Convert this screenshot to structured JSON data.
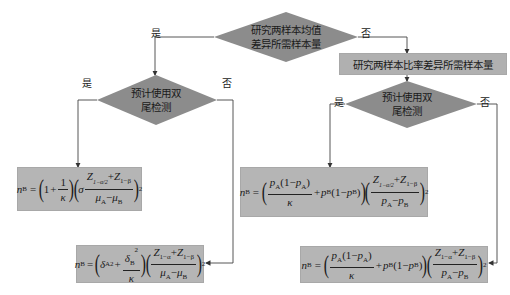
{
  "diagram": {
    "type": "flowchart",
    "colors": {
      "diamond_fill": "#8c8c8c",
      "box_fill": "#b5b5b5",
      "line": "#444444",
      "background": "#ffffff"
    },
    "top_decision": {
      "line1": "研究两样本均值",
      "line2": "差异所需样本量",
      "yes_label": "是",
      "no_label": "否"
    },
    "proportion_box": {
      "text": "研究两样本比率差异所需样本量"
    },
    "left_decision": {
      "line1": "预计使用双",
      "line2": "尾检测",
      "yes_label": "是",
      "no_label": "否"
    },
    "right_decision": {
      "line1": "预计使用双",
      "line2": "尾检测",
      "yes_label": "是",
      "no_label": "否"
    },
    "formulas": {
      "mean_two_tailed": "n_B = (1 + 1/κ)(σ (Z_{1-α/2} + Z_{1-β}) / (μ_A - μ_B))^2",
      "mean_one_tailed": "n_B = (δ_A^2 + δ_B^2/κ)((Z_{1-α} + Z_{1-β}) / (μ_A - μ_B))^2",
      "prop_two_tailed": "n_B = (p_A(1-p_A)/κ + p_B(1-p_B))((Z_{1-α/2} + Z_{1-β}) / (p_A - p_B))^2",
      "prop_one_tailed": "n_B = (p_A(1-p_A)/κ + p_B(1-p_B))((Z_{1-α} + Z_{1-β}) / (p_A - p_B))^2"
    },
    "glyphs": {
      "nB": "n",
      "B": "B",
      "A": "A",
      "eq": "=",
      "one": "1",
      "plus": "+",
      "minus": "−",
      "kappa": "κ",
      "sigma": "σ",
      "delta": "δ",
      "Z": "Z",
      "mu": "μ",
      "p": "p",
      "two": "2",
      "one_minus_alpha_half": "1−α/2",
      "one_minus_alpha": "1−α",
      "one_minus_beta": "1−β",
      "lparen": "(",
      "rparen": ")"
    }
  }
}
